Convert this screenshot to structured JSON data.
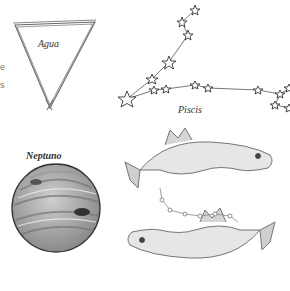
{
  "illustration": {
    "water_symbol": {
      "label": "Agua"
    },
    "constellation": {
      "label": "Piscis"
    },
    "planet": {
      "label": "Neptuno"
    },
    "edge_text": [
      "e",
      "s"
    ]
  },
  "colors": {
    "ink": "#555555",
    "paper": "#ffffff"
  }
}
